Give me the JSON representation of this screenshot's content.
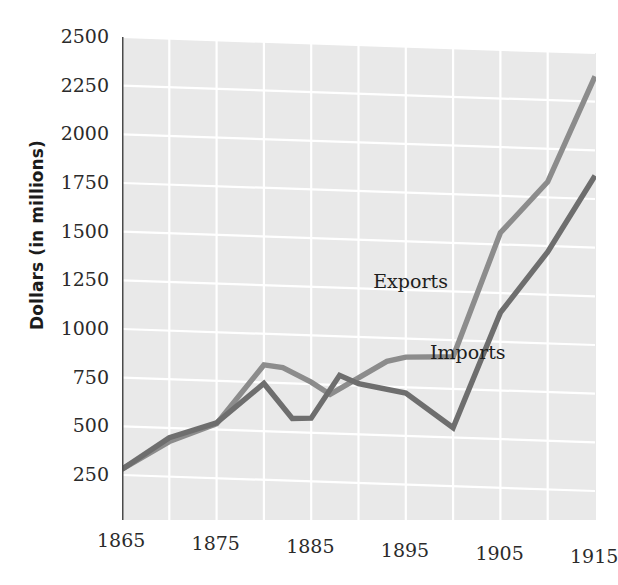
{
  "chart_data": {
    "type": "line",
    "title": "",
    "xlabel": "",
    "ylabel": "Dollars (in millions)",
    "xlim": [
      1865,
      1915
    ],
    "ylim": [
      0,
      2500
    ],
    "xticks": [
      "1865",
      "1875",
      "1885",
      "1895",
      "1905",
      "1915"
    ],
    "yticks": [
      "250",
      "500",
      "750",
      "1000",
      "1250",
      "1500",
      "1750",
      "2000",
      "2250",
      "2500"
    ],
    "grid": true,
    "legend_position": "inline-annotation",
    "plot_background": "#e9e9e9",
    "gridline_color": "#ffffff",
    "series": [
      {
        "name": "Exports",
        "color": "#8c8c8c",
        "label_x": 1896,
        "label_y": 1290,
        "x": [
          1865,
          1870,
          1875,
          1880,
          1882,
          1885,
          1887,
          1890,
          1893,
          1895,
          1900,
          1905,
          1910,
          1915
        ],
        "values": [
          280,
          430,
          530,
          840,
          830,
          760,
          700,
          790,
          880,
          905,
          915,
          1560,
          1830,
          2380
        ]
      },
      {
        "name": "Imports",
        "color": "#6e6e6e",
        "label_x": 1902,
        "label_y": 935,
        "x": [
          1865,
          1870,
          1875,
          1880,
          1883,
          1885,
          1888,
          1890,
          1895,
          1900,
          1905,
          1910,
          1915
        ],
        "values": [
          280,
          450,
          535,
          745,
          570,
          575,
          800,
          760,
          720,
          550,
          1150,
          1470,
          1870
        ]
      }
    ]
  },
  "axis": {
    "ylabel": "Dollars (in millions)"
  }
}
